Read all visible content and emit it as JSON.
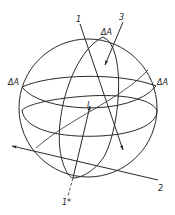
{
  "diagram": {
    "title": "",
    "colors": {
      "ink": "#2a2a2a",
      "background": "#ffffff"
    },
    "sphere": {
      "cx": 88,
      "cy": 108,
      "r": 69
    },
    "labels": {
      "axis1": "1",
      "axis3": "3",
      "axis2": "2",
      "axis1star": "1*",
      "center": "I",
      "delta_top": "ΔA",
      "delta_left": "ΔA",
      "delta_right": "ΔA"
    }
  }
}
